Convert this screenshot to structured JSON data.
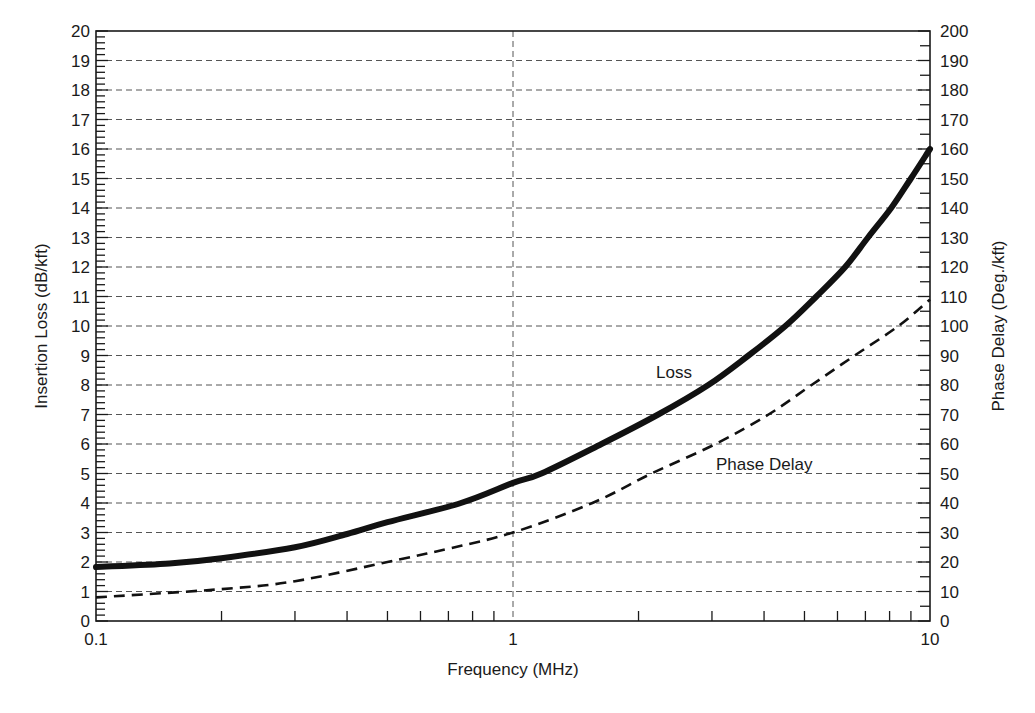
{
  "chart_data": {
    "type": "line",
    "title": "",
    "xlabel": "Frequency (MHz)",
    "ylabel": "Insertion Loss (dB/kft)",
    "y2label": "Phase Delay (Deg./kft)",
    "xscale": "log",
    "xlim": [
      0.1,
      10
    ],
    "ylim": [
      0,
      20
    ],
    "y2lim": [
      0,
      200
    ],
    "x_ticks": [
      "0.1",
      "1",
      "10"
    ],
    "y_ticks": [
      0,
      1,
      2,
      3,
      4,
      5,
      6,
      7,
      8,
      9,
      10,
      11,
      12,
      13,
      14,
      15,
      16,
      17,
      18,
      19,
      20
    ],
    "y2_ticks": [
      0,
      10,
      20,
      30,
      40,
      50,
      60,
      70,
      80,
      90,
      100,
      110,
      120,
      130,
      140,
      150,
      160,
      170,
      180,
      190,
      200
    ],
    "grid": true,
    "legend": "inline labels",
    "annotations": [
      {
        "text": "Loss",
        "x": 2.7,
        "y": 8.3
      },
      {
        "text": "Phase Delay",
        "x": 5.0,
        "y": 5.3
      }
    ],
    "series": [
      {
        "name": "Loss",
        "axis": "left",
        "style": "solid-thick",
        "x": [
          0.1,
          0.15,
          0.2,
          0.3,
          0.4,
          0.5,
          0.75,
          1.0,
          1.17,
          1.63,
          2.23,
          2.94,
          3.67,
          4.5,
          5.34,
          6.26,
          7.1,
          8.07,
          9.0,
          10.0
        ],
        "values": [
          1.83,
          1.95,
          2.13,
          2.5,
          2.95,
          3.35,
          4.0,
          4.68,
          5.0,
          6.0,
          7.0,
          8.0,
          9.0,
          10.0,
          11.0,
          12.0,
          13.0,
          14.0,
          15.0,
          16.0
        ]
      },
      {
        "name": "Phase Delay",
        "axis": "right",
        "style": "dashed",
        "x": [
          0.1,
          0.2,
          0.3,
          0.5,
          0.7,
          1.0,
          1.55,
          2.15,
          3.06,
          4.1,
          5.2,
          6.6,
          8.4,
          10.0
        ],
        "values": [
          8,
          10.8,
          13.5,
          20,
          24.5,
          30,
          40,
          50,
          60,
          70,
          80,
          90,
          100,
          109
        ]
      }
    ]
  }
}
